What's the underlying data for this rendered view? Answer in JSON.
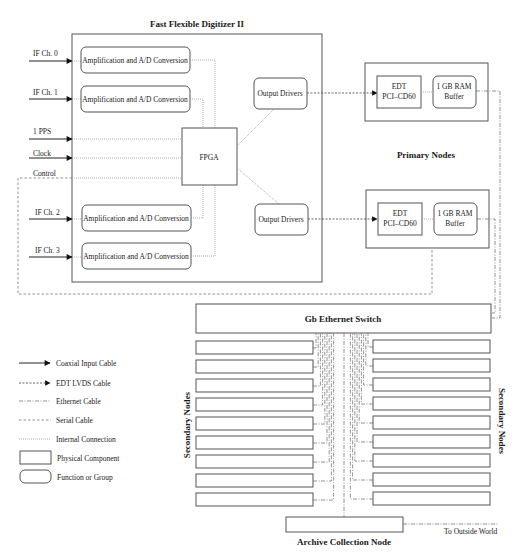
{
  "title": "Fast Flexible Digitizer II",
  "inputs": [
    {
      "label": "IF Ch. 0",
      "y": 61
    },
    {
      "label": "IF Ch. 1",
      "y": 99
    },
    {
      "label": "1 PPS",
      "y": 138
    },
    {
      "label": "Clock",
      "y": 158
    },
    {
      "label": "Control",
      "y": 178
    },
    {
      "label": "IF Ch. 2",
      "y": 219
    },
    {
      "label": "IF Ch. 3",
      "y": 257
    }
  ],
  "amp_boxes": [
    {
      "label": "Amplification and A/D Conversion",
      "y": 47
    },
    {
      "label": "Amplification and A/D Conversion",
      "y": 86
    },
    {
      "label": "Amplification and A/D Conversion",
      "y": 205
    },
    {
      "label": "Amplification and A/D Conversion",
      "y": 243
    }
  ],
  "fpga": {
    "label": "FPGA"
  },
  "output_drivers": [
    {
      "label": "Output Drivers",
      "y": 78
    },
    {
      "label": "Output Drivers",
      "y": 204
    }
  ],
  "primary_nodes": {
    "label": "Primary Nodes",
    "nodes": [
      {
        "edt_line1": "EDT",
        "edt_line2": "PCI–CD60",
        "ram_line1": "1 GB RAM",
        "ram_line2": "Buffer",
        "y": 63
      },
      {
        "edt_line1": "EDT",
        "edt_line2": "PCI–CD60",
        "ram_line1": "1 GB RAM",
        "ram_line2": "Buffer",
        "y": 190
      }
    ]
  },
  "switch": {
    "label": "Gb Ethernet Switch"
  },
  "secondary_nodes": {
    "left_label": "Secondary Nodes",
    "right_label": "Secondary Nodes",
    "left_count": 9,
    "right_count": 9
  },
  "archive": {
    "label": "Archive Collection Node",
    "outside_label": "To Outside World"
  },
  "legend": [
    {
      "type": "coax",
      "label": "Coaxial Input Cable"
    },
    {
      "type": "lvds",
      "label": "EDT LVDS Cable"
    },
    {
      "type": "eth",
      "label": "Ethernet Cable"
    },
    {
      "type": "serial",
      "label": "Serial Cable"
    },
    {
      "type": "internal",
      "label": "Internal Connection"
    },
    {
      "type": "physical",
      "label": "Physical Component"
    },
    {
      "type": "function",
      "label": "Function or Group"
    }
  ],
  "colors": {
    "stroke": "#555555",
    "text": "#1a1a1a",
    "background": "#ffffff"
  }
}
